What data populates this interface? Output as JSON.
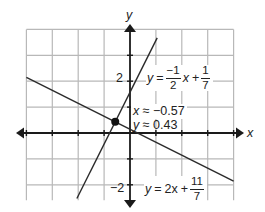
{
  "chart_data": {
    "type": "line",
    "title": "",
    "xlabel": "x",
    "ylabel": "y",
    "xlim": [
      -4,
      4
    ],
    "ylim": [
      -2.6,
      4
    ],
    "grid": true,
    "grid_step": 1,
    "y_tick_labels": [
      {
        "value": 2,
        "label": "2"
      },
      {
        "value": -2,
        "label": "−2"
      }
    ],
    "series": [
      {
        "name": "steep line",
        "slope": 2,
        "intercept": 1.5714,
        "label_text": "y = −1/2 x + 1/7",
        "x_range": [
          -2.05,
          1.05
        ]
      },
      {
        "name": "shallow line",
        "slope": -0.5,
        "intercept": 0.1429,
        "label_text": "y = 2x + 11/7",
        "x_range": [
          -4,
          4
        ]
      }
    ],
    "intersection": {
      "x": -0.57,
      "y": 0.43
    },
    "annotations": [
      "y = −1/2 x + 1/7",
      "y = 2x + 11/7",
      "x ≈ −0.57",
      "y ≈ 0.43"
    ]
  },
  "axes": {
    "x_label": "x",
    "y_label": "y",
    "tick_pos2": "2",
    "tick_neg2": "−2"
  },
  "labels": {
    "eq_top": {
      "lhs": "y",
      "eq": "=",
      "num1": "−1",
      "den1": "2",
      "var": "x",
      "plus": "+",
      "num2": "1",
      "den2": "7"
    },
    "eq_bottom": {
      "lhs": "y",
      "eq": "=",
      "coef": "2x",
      "plus": "+",
      "num": "11",
      "den": "7"
    },
    "intersect_x": {
      "var": "x",
      "approx": "≈ −0.57"
    },
    "intersect_y": {
      "var": "y",
      "approx": "≈ 0.43"
    }
  },
  "colors": {
    "grid": "#b8b8b8",
    "axis": "#1a1a1a",
    "line": "#2a2a2a",
    "point": "#111111"
  }
}
